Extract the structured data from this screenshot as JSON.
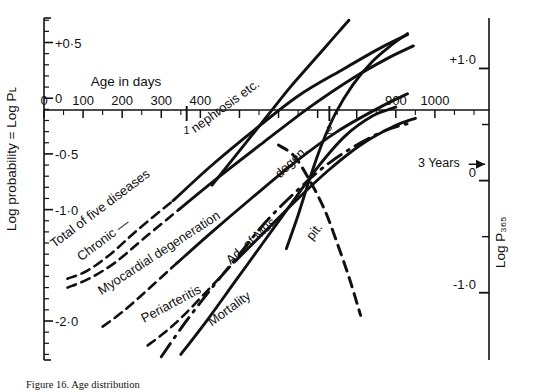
{
  "figure": {
    "caption": "Figure 16. Age distribution",
    "background": "#ffffff",
    "ink": "#111111"
  },
  "chart_data": {
    "type": "line",
    "title": "",
    "xlabel": "Age in days",
    "ylabel": "Log probability = Log Pʟ",
    "y2label": "Log P₃₆₅",
    "grid": false,
    "legend": "inline-curve-labels",
    "xlim": [
      0,
      1100
    ],
    "ylim": [
      -2.35,
      0.72
    ],
    "y2lim": [
      -1.6,
      1.45
    ],
    "x_ticks": [
      0,
      100,
      200,
      300,
      400,
      500,
      600,
      700,
      800,
      900,
      1000
    ],
    "x_tick_labels": [
      "0",
      "100",
      "200",
      "300",
      "400",
      "",
      "",
      "",
      "",
      "900",
      "1000"
    ],
    "x_minor_step": 50,
    "year_marks": [
      {
        "x": 365,
        "label": "1"
      },
      {
        "x": 730,
        "label": "2"
      }
    ],
    "y_ticks": [
      0.5,
      0.0,
      -0.5,
      -1.0,
      -2.0
    ],
    "y_tick_labels": [
      "+0·5",
      "0",
      "-0·5",
      "-1·0",
      "-2·0"
    ],
    "y_minor_step": 0.1,
    "y2_ticks": [
      1.0,
      0.0,
      -1.0
    ],
    "y2_tick_labels": [
      "+1·0",
      "0",
      "-1·0"
    ],
    "annotations": [
      {
        "text": "3 Years",
        "x": 1010,
        "y": -0.62,
        "points_to": "right-axis-zero",
        "arrow": true
      }
    ],
    "series": [
      {
        "name": "Total of five diseases",
        "label": "Total of five diseases",
        "style": "solid-with-dashed-start",
        "points": [
          [
            60,
            -1.62
          ],
          [
            110,
            -1.55
          ],
          [
            170,
            -1.4
          ],
          [
            240,
            -1.18
          ],
          [
            330,
            -0.92
          ],
          [
            430,
            -0.6
          ],
          [
            540,
            -0.28
          ],
          [
            650,
            0.02
          ],
          [
            760,
            0.25
          ],
          [
            860,
            0.45
          ],
          [
            930,
            0.57
          ]
        ]
      },
      {
        "name": "Chronic degeneration",
        "label": "Chronic —",
        "style": "solid-with-dashed-start",
        "points": [
          [
            60,
            -1.7
          ],
          [
            115,
            -1.62
          ],
          [
            180,
            -1.48
          ],
          [
            255,
            -1.26
          ],
          [
            345,
            -1.0
          ],
          [
            450,
            -0.7
          ],
          [
            560,
            -0.4
          ],
          [
            680,
            -0.08
          ],
          [
            790,
            0.18
          ],
          [
            880,
            0.36
          ],
          [
            945,
            0.47
          ]
        ]
      },
      {
        "name": "Myocardial degeneration",
        "label": "Myocardial degeneration",
        "style": "solid-with-dashed-start",
        "points": [
          [
            150,
            -2.05
          ],
          [
            200,
            -1.92
          ],
          [
            265,
            -1.72
          ],
          [
            340,
            -1.48
          ],
          [
            430,
            -1.2
          ],
          [
            530,
            -0.9
          ],
          [
            640,
            -0.58
          ],
          [
            750,
            -0.3
          ],
          [
            860,
            -0.08
          ],
          [
            930,
            0.04
          ]
        ]
      },
      {
        "name": "Nephrosis etc.",
        "label": "nephrosis etc.",
        "style": "solid",
        "points": [
          [
            430,
            -0.78
          ],
          [
            480,
            -0.56
          ],
          [
            530,
            -0.34
          ],
          [
            580,
            -0.12
          ],
          [
            630,
            0.1
          ],
          [
            680,
            0.3
          ],
          [
            720,
            0.46
          ],
          [
            755,
            0.6
          ],
          [
            780,
            0.7
          ]
        ]
      },
      {
        "name": "Degeneration",
        "label": "degen.",
        "style": "solid",
        "points": [
          [
            620,
            -1.35
          ],
          [
            650,
            -1.05
          ],
          [
            680,
            -0.72
          ],
          [
            710,
            -0.42
          ],
          [
            745,
            -0.14
          ],
          [
            790,
            0.12
          ],
          [
            840,
            0.33
          ],
          [
            890,
            0.48
          ],
          [
            930,
            0.58
          ]
        ]
      },
      {
        "name": "Periarteritis",
        "label": "Periarteritis",
        "style": "solid-with-dashed-start",
        "points": [
          [
            265,
            -2.22
          ],
          [
            310,
            -2.1
          ],
          [
            360,
            -1.94
          ],
          [
            420,
            -1.72
          ],
          [
            490,
            -1.46
          ],
          [
            570,
            -1.18
          ],
          [
            650,
            -0.9
          ],
          [
            730,
            -0.64
          ],
          [
            810,
            -0.42
          ],
          [
            890,
            -0.26
          ],
          [
            950,
            -0.18
          ]
        ]
      },
      {
        "name": "Adenoma of pituitary",
        "label": "Ad. of Mus.",
        "style": "solid",
        "points": [
          [
            350,
            -2.3
          ],
          [
            420,
            -1.98
          ],
          [
            490,
            -1.64
          ],
          [
            560,
            -1.3
          ],
          [
            630,
            -0.96
          ],
          [
            700,
            -0.62
          ],
          [
            770,
            -0.34
          ],
          [
            840,
            -0.16
          ],
          [
            900,
            -0.08
          ]
        ]
      },
      {
        "name": "Pituitary",
        "label": "pit.",
        "style": "dashed",
        "points": [
          [
            600,
            -0.42
          ],
          [
            640,
            -0.52
          ],
          [
            680,
            -0.74
          ],
          [
            720,
            -1.02
          ],
          [
            755,
            -1.35
          ],
          [
            785,
            -1.66
          ],
          [
            810,
            -1.95
          ]
        ]
      },
      {
        "name": "Mortality",
        "label": "Mortality",
        "style": "dash-dot",
        "points": [
          [
            300,
            -2.32
          ],
          [
            360,
            -2.02
          ],
          [
            430,
            -1.7
          ],
          [
            500,
            -1.4
          ],
          [
            570,
            -1.1
          ],
          [
            650,
            -0.82
          ],
          [
            730,
            -0.58
          ],
          [
            810,
            -0.4
          ],
          [
            880,
            -0.28
          ],
          [
            940,
            -0.22
          ]
        ]
      }
    ]
  }
}
